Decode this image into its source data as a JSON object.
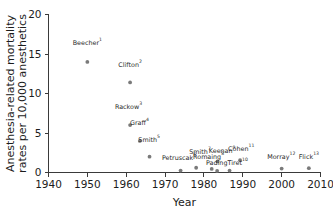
{
  "chart_data": {
    "type": "scatter",
    "title": "",
    "xlabel": "Year",
    "ylabel": "Anesthesia-related mortality rates per 10,000 anesthetics",
    "ylabel_line1": "Anesthesia-related mortality",
    "ylabel_line2": "rates per 10,000 anesthetics",
    "xlim": [
      1940,
      2010
    ],
    "ylim": [
      0,
      20
    ],
    "xticks": [
      1940,
      1950,
      1960,
      1970,
      1980,
      1990,
      2000,
      2010
    ],
    "xtick_labels": [
      "1940",
      "1950",
      "1960",
      "1970",
      "1980",
      "1990",
      "2000",
      "2010"
    ],
    "yticks": [
      0,
      5,
      10,
      15,
      20
    ],
    "ytick_labels": [
      "0",
      "5",
      "10",
      "15",
      "20"
    ],
    "grid": false,
    "legend": "none",
    "marker_color": "#7a7a7a",
    "axis_color": "#3a3a3a",
    "points": [
      {
        "label": "Beecher",
        "sup": "1",
        "x": 1950,
        "y": 14.0,
        "lx": 1950.0,
        "ly": 16.1,
        "anchor": "middle"
      },
      {
        "label": "Clifton",
        "sup": "2",
        "x": 1961,
        "y": 11.4,
        "lx": 1961.0,
        "ly": 13.4,
        "anchor": "middle"
      },
      {
        "label": "Rackow",
        "sup": "3",
        "x": 1961,
        "y": 6.0,
        "lx": 1960.6,
        "ly": 8.0,
        "anchor": "middle"
      },
      {
        "label": "Graff",
        "sup": "4",
        "x": 1963.5,
        "y": 4.0,
        "lx": 1963.4,
        "ly": 6.0,
        "anchor": "middle"
      },
      {
        "label": "Smith",
        "sup": "5",
        "x": 1966,
        "y": 2.0,
        "lx": 1965.9,
        "ly": 3.9,
        "anchor": "middle"
      },
      {
        "label": "Petruscak",
        "sup": "6",
        "x": 1974,
        "y": 0.25,
        "lx": 1973.6,
        "ly": 1.55,
        "anchor": "middle"
      },
      {
        "label": "Smith",
        "sup": "7",
        "x": 1978,
        "y": 0.6,
        "lx": 1979.0,
        "ly": 2.35,
        "anchor": "middle"
      },
      {
        "label": "Romaing",
        "sup": "8",
        "x": 1982,
        "y": 0.45,
        "lx": 1981.2,
        "ly": 1.65,
        "anchor": "middle"
      },
      {
        "label": "Keenan",
        "sup": "9",
        "x": 1983.5,
        "y": 1.4,
        "lx": 1984.7,
        "ly": 2.45,
        "anchor": "middle"
      },
      {
        "label": "Pading",
        "sup": "",
        "x": 1983.4,
        "y": 0.2,
        "lx": 1983.3,
        "ly": 0.95,
        "anchor": "middle"
      },
      {
        "label": "Tiret",
        "sup": "10",
        "x": 1986.6,
        "y": 0.25,
        "lx": 1988.7,
        "ly": 0.95,
        "anchor": "middle"
      },
      {
        "label": "Cohen",
        "sup": "11",
        "x": 1989.3,
        "y": 1.55,
        "lx": 1989.6,
        "ly": 2.75,
        "anchor": "middle"
      },
      {
        "label": "Morray",
        "sup": "12",
        "x": 2000,
        "y": 0.5,
        "lx": 1999.9,
        "ly": 1.7,
        "anchor": "middle"
      },
      {
        "label": "Flick",
        "sup": "13",
        "x": 2007,
        "y": 0.55,
        "lx": 2007.0,
        "ly": 1.75,
        "anchor": "middle"
      }
    ]
  }
}
